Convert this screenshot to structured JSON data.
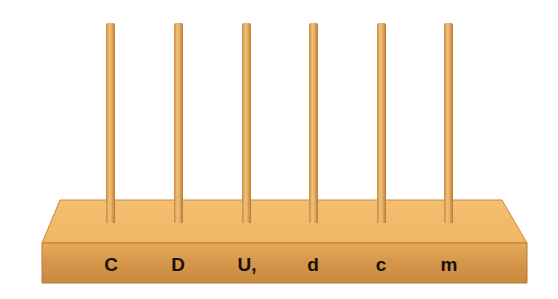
{
  "scene": {
    "description": "Wooden place-value abacus base with six vertical rods",
    "rod_color": "#e8b066",
    "base_top_color": "#f0b868",
    "base_front_color": "#d89a4a"
  },
  "labels": [
    "C",
    "D",
    "U,",
    "d",
    "c",
    "m"
  ],
  "rods": [
    {
      "x": 106,
      "label": "C"
    },
    {
      "x": 174,
      "label": "D"
    },
    {
      "x": 242,
      "label": "U,"
    },
    {
      "x": 309,
      "label": "d"
    },
    {
      "x": 377,
      "label": "c"
    },
    {
      "x": 444,
      "label": "m"
    }
  ]
}
